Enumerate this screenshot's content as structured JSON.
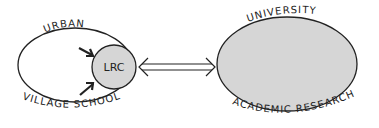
{
  "diagram": {
    "left_node": {
      "top_label": "URBAN",
      "bottom_label": "VILLAGE SCHOOL",
      "fill": "#ffffff",
      "inner_node": {
        "label": "LRC",
        "fill": "#d6d6d6"
      }
    },
    "right_node": {
      "top_label": "UNIVERSITY",
      "bottom_label": "ACADEMIC RESEARCH",
      "fill": "#d6d6d6"
    },
    "connector": {
      "type": "double-arrow",
      "from": "LRC",
      "to": "UNIVERSITY"
    },
    "stroke_color": "#222222"
  }
}
